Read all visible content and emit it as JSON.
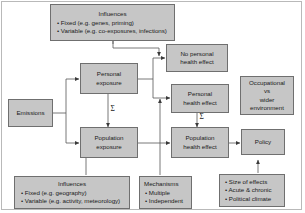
{
  "diagram": {
    "colors": {
      "node_fill": "#c6c6c6",
      "node_stroke": "#6f6f6f",
      "frame_stroke": "#b9b9b9",
      "wire": "#555555",
      "background": "#ffffff"
    },
    "nodes": {
      "influences_top": {
        "heading": "Influences",
        "bullets": [
          "• Fixed (e.g. genes, priming)",
          "• Variable (e.g. co-exposures, infections)"
        ]
      },
      "emissions": {
        "label": "Emissions"
      },
      "personal_exposure": {
        "line1": "Personal",
        "line2": "exposure"
      },
      "population_exposure": {
        "line1": "Population",
        "line2": "exposure"
      },
      "no_personal_health_effect": {
        "line1": "No personal",
        "line2": "health effect"
      },
      "personal_health_effect": {
        "line1": "Personal",
        "line2": "health effect"
      },
      "population_health_effect": {
        "line1": "Population",
        "line2": "health effect"
      },
      "occupational_vs_wider": {
        "line1": "Occupational",
        "line2": "vs",
        "line3": "wider",
        "line4": "environment"
      },
      "policy": {
        "label": "Policy"
      },
      "influences_bottom": {
        "heading": "Influences",
        "bullets": [
          "• Fixed (e.g. geography)",
          "• Variable (e.g. activity, meteorology)"
        ]
      },
      "mechanisms": {
        "heading": "Mechanisms",
        "bullets": [
          "• Multiple",
          "• Independent"
        ]
      },
      "policy_factors": {
        "bullets": [
          "• Size of effects",
          "• Acute & chronic",
          "• Political climate"
        ]
      }
    },
    "annotations": {
      "sigma_exposure": "Σ",
      "sigma_health_effect": "Σ"
    }
  }
}
